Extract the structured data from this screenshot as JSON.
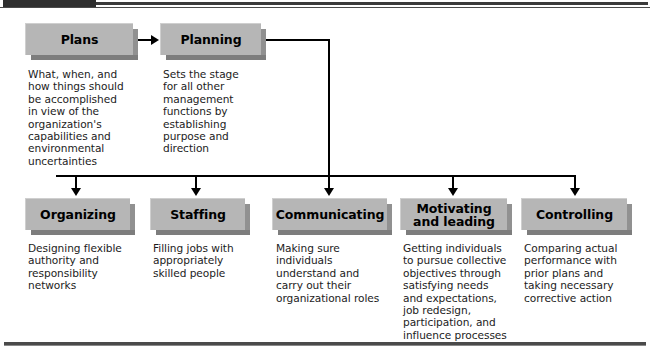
{
  "page": {
    "background_color": "#ffffff",
    "box_fill_color": "#b6b6b6",
    "box_shadow_color": "#7d7d7d",
    "line_color": "#000000",
    "rule_color": "#4a4a4a"
  },
  "header": {
    "dark_block_label": "",
    "rule_label": ""
  },
  "nodes": {
    "plans": {
      "label": "Plans",
      "description": "What, when, and\nhow things should\nbe accomplished\nin view of the\norganization's\ncapabilities and\nenvironmental\nuncertainties"
    },
    "planning": {
      "label": "Planning",
      "description": "Sets the stage\nfor all other\nmanagement\nfunctions by\nestablishing\npurpose and\ndirection"
    },
    "organizing": {
      "label": "Organizing",
      "description": "Designing flexible\nauthority and\nresponsibility\nnetworks"
    },
    "staffing": {
      "label": "Staffing",
      "description": "Filling jobs with\nappropriately\nskilled people"
    },
    "communicating": {
      "label": "Communicating",
      "description": "Making sure\nindividuals\nunderstand and\ncarry out their\norganizational roles"
    },
    "motivating": {
      "label": "Motivating\nand leading",
      "description": "Getting individuals\nto pursue collective\nobjectives through\nsatisfying needs\nand expectations,\njob redesign,\nparticipation, and\ninfluence processes"
    },
    "controlling": {
      "label": "Controlling",
      "description": "Comparing actual\nperformance with\nprior plans and\ntaking necessary\ncorrective action"
    }
  },
  "connectors": {
    "plans_to_planning": "arrow-right",
    "planning_to_bus": "elbow-right-down",
    "bus_to_organizing": "arrow-down",
    "bus_to_staffing": "arrow-down",
    "bus_to_communicating": "arrow-down",
    "bus_to_motivating": "arrow-down",
    "bus_to_controlling": "arrow-down"
  }
}
